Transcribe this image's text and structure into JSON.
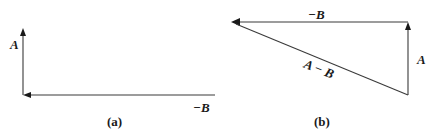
{
  "diagram": {
    "panel_a": {
      "caption": "(a)",
      "labels": {
        "vertical_vector": "A",
        "horizontal_vector": "−B"
      }
    },
    "panel_b": {
      "caption": "(b)",
      "labels": {
        "top_vector": "−B",
        "right_vector": "A",
        "diagonal_vector": "A − B"
      }
    },
    "colors": {
      "line": "#3a3a3a",
      "text": "#1a1a1a",
      "background": "#ffffff"
    }
  }
}
